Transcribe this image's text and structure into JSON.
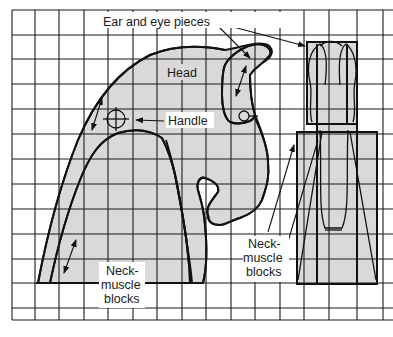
{
  "diagram": {
    "type": "woodworking-pattern-grid",
    "grid": {
      "columns": 15,
      "rows": 12,
      "line_color": "#1a1a1a",
      "background": "#ffffff"
    },
    "fill_color": "#d9d9d9",
    "labels": {
      "ear_eye_pieces": "Ear and eye pieces",
      "head": "Head",
      "handle": "Handle",
      "neck_left_line1": "Neck-",
      "neck_left_line2": "muscle",
      "neck_left_line3": "blocks",
      "neck_right_line1": "Neck-",
      "neck_right_line2": "muscle",
      "neck_right_line3": "blocks"
    },
    "views": [
      {
        "name": "side-view",
        "parts": [
          "head",
          "ear-and-eye-piece",
          "neck-muscle-block",
          "handle-hole"
        ]
      },
      {
        "name": "front-view",
        "parts": [
          "head-front",
          "ear-and-eye-pieces",
          "neck-muscle-blocks"
        ]
      }
    ]
  }
}
